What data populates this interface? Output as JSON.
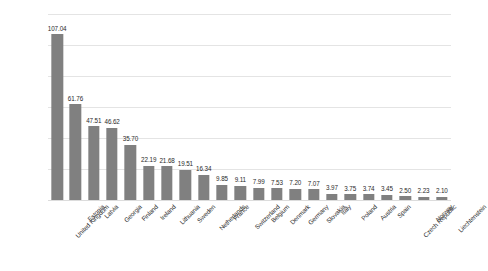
{
  "chart_data": {
    "type": "bar",
    "title": "",
    "subtitle": "",
    "xlabel": "",
    "ylabel": "",
    "ylim": [
      0,
      120
    ],
    "grid": true,
    "gridlines": [
      0,
      20,
      40,
      60,
      80,
      100,
      120
    ],
    "legend": "none",
    "bar_color": "#808080",
    "gridline_color": "#e4e4e4",
    "background_color": "#ffffff",
    "value_label_format": "2 decimals",
    "categories": [
      "United Kingdom",
      "Estonia",
      "Latvia",
      "Georgia",
      "Finland",
      "Ireland",
      "Lithuania",
      "Sweden",
      "Netherlands",
      "France",
      "Switzerland",
      "Belgium",
      "Denmark",
      "Germany",
      "Slovakia",
      "Italy",
      "Poland",
      "Austria",
      "Spain",
      "Czech Republic",
      "Norway",
      "Liechtenstein"
    ],
    "values": [
      107.04,
      61.76,
      47.51,
      46.62,
      35.7,
      22.19,
      21.68,
      19.51,
      16.34,
      9.85,
      9.11,
      7.99,
      7.53,
      7.2,
      7.07,
      3.97,
      3.75,
      3.74,
      3.45,
      2.5,
      2.23,
      2.1
    ],
    "value_labels": [
      "107.04",
      "61.76",
      "47.51",
      "46.62",
      "35.70",
      "22.19",
      "21.68",
      "19.51",
      "16.34",
      "9.85",
      "9.11",
      "7.99",
      "7.53",
      "7.20",
      "7.07",
      "3.97",
      "3.75",
      "3.74",
      "3.45",
      "2.50",
      "2.23",
      "2.10"
    ]
  }
}
